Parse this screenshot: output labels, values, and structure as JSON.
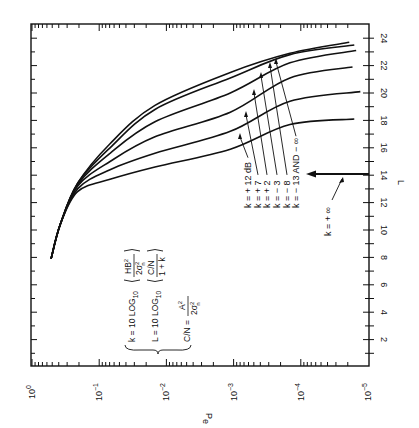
{
  "chart_data": {
    "type": "line",
    "orientation": "rotated 90deg counter-clockwise (page printed sideways)",
    "title": "",
    "xlabel": "Pe",
    "ylabel": "L",
    "x_scale": "log",
    "x_range": [
      1,
      1e-05
    ],
    "x_ticks": [
      {
        "value": 1,
        "base": "10",
        "exp": "0"
      },
      {
        "value": 0.1,
        "base": "10",
        "exp": "−1"
      },
      {
        "value": 0.01,
        "base": "10",
        "exp": "−2"
      },
      {
        "value": 0.001,
        "base": "10",
        "exp": "−3"
      },
      {
        "value": 0.0001,
        "base": "10",
        "exp": "−4"
      },
      {
        "value": 1e-05,
        "base": "10",
        "exp": "−5"
      }
    ],
    "y_range": [
      0,
      24
    ],
    "y_ticks": [
      "2",
      "4",
      "6",
      "8",
      "10",
      "12",
      "14",
      "16",
      "18",
      "20",
      "22",
      "24"
    ],
    "grid": false,
    "series": [
      {
        "name": "k = − 13 AND − ∞",
        "points": [
          [
            0.52,
            7.9
          ],
          [
            0.38,
            10.4
          ],
          [
            0.21,
            13.4
          ],
          [
            0.069,
            16.3
          ],
          [
            0.0148,
            19.1
          ],
          [
            0.00112,
            21.5
          ],
          [
            0.000145,
            22.9
          ],
          [
            1.9e-05,
            23.7
          ]
        ]
      },
      {
        "name": "k = − 8",
        "points": [
          [
            0.52,
            7.9
          ],
          [
            0.38,
            10.4
          ],
          [
            0.21,
            13.4
          ],
          [
            0.069,
            16.0
          ],
          [
            0.0148,
            18.8
          ],
          [
            0.00112,
            21.1
          ],
          [
            0.000145,
            22.8
          ],
          [
            1.6e-05,
            23.5
          ]
        ]
      },
      {
        "name": "k = − 3",
        "points": [
          [
            0.52,
            7.9
          ],
          [
            0.38,
            10.4
          ],
          [
            0.21,
            13.3
          ],
          [
            0.069,
            15.6
          ],
          [
            0.0148,
            17.9
          ],
          [
            0.00112,
            20.0
          ],
          [
            0.000145,
            22.2
          ],
          [
            1.5e-05,
            23.1
          ]
        ]
      },
      {
        "name": "k = + 2",
        "points": [
          [
            0.52,
            7.9
          ],
          [
            0.38,
            10.4
          ],
          [
            0.21,
            13.2
          ],
          [
            0.069,
            15.0
          ],
          [
            0.0148,
            16.8
          ],
          [
            0.00112,
            18.6
          ],
          [
            0.000145,
            21.1
          ],
          [
            1.7e-05,
            21.9
          ]
        ]
      },
      {
        "name": "k = + 7",
        "points": [
          [
            0.52,
            7.9
          ],
          [
            0.38,
            10.4
          ],
          [
            0.21,
            13.0
          ],
          [
            0.069,
            14.4
          ],
          [
            0.0148,
            15.6
          ],
          [
            0.00112,
            17.2
          ],
          [
            0.000145,
            19.4
          ],
          [
            1.3e-05,
            20.1
          ]
        ]
      },
      {
        "name": "k = + 12 dB",
        "points": [
          [
            0.52,
            7.9
          ],
          [
            0.38,
            10.4
          ],
          [
            0.21,
            12.8
          ],
          [
            0.069,
            13.7
          ],
          [
            0.0148,
            14.6
          ],
          [
            0.00112,
            15.9
          ],
          [
            0.000145,
            17.7
          ],
          [
            1.6e-05,
            18.1
          ]
        ]
      }
    ],
    "annotations": [
      {
        "text": "k = + ∞",
        "type": "arrow",
        "at_L": 14,
        "note": "horizontal arrow at L = 14 pointing from the L axis toward increasing Pe"
      }
    ],
    "legend": "leader-line labels near Pe ≈ 10^-3 to 10^-4"
  },
  "labels": {
    "curves": [
      "k = + 12 dB",
      "k = + 7",
      "k = + 2",
      "k = − 3",
      "k = − 8",
      "k = − 13 AND − ∞"
    ],
    "k_infinity": "k = + ∞",
    "x_axis_title": "P",
    "x_axis_title_sub": "e",
    "y_axis_title": "L"
  },
  "formulas": {
    "k_lhs": "k = 10 LOG",
    "k_sub": "10",
    "k_num": "HB",
    "k_num_sup": "2",
    "k_den": "2σ",
    "k_den_sup": "2",
    "k_den_sub": "n",
    "l_lhs": "L = 10 LOG",
    "l_sub": "10",
    "l_num": "C/N",
    "l_den": "1 + k",
    "cn_lhs": "C/N =",
    "cn_num": "A",
    "cn_num_sup": "2",
    "cn_den": "2σ",
    "cn_den_sup": "2",
    "cn_den_sub": "n"
  }
}
